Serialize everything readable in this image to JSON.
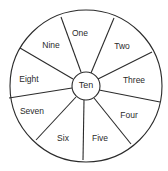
{
  "diagram": {
    "type": "wheel",
    "center_label": "Ten",
    "segments": [
      {
        "label": "One",
        "x": 80,
        "y": 34
      },
      {
        "label": "Two",
        "x": 122,
        "y": 47
      },
      {
        "label": "Three",
        "x": 134,
        "y": 81
      },
      {
        "label": "Four",
        "x": 129,
        "y": 116
      },
      {
        "label": "Five",
        "x": 100,
        "y": 139
      },
      {
        "label": "Six",
        "x": 63,
        "y": 139
      },
      {
        "label": "Seven",
        "x": 32,
        "y": 112
      },
      {
        "label": "Eight",
        "x": 29,
        "y": 80
      },
      {
        "label": "Nine",
        "x": 51,
        "y": 46
      }
    ],
    "colors": {
      "line": "#2b2b2b",
      "text": "#2a2a2a",
      "background": "#ffffff"
    }
  }
}
